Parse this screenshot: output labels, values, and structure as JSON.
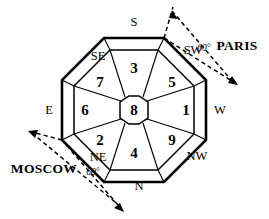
{
  "diagram": {
    "background_color": "#ffffff",
    "line_color": "#000000",
    "center": {
      "label": "8",
      "name": "center-cell"
    },
    "sectors": [
      {
        "label": "1",
        "direction": "W",
        "x": 186,
        "y": 110
      },
      {
        "label": "5",
        "direction": "SW",
        "x": 172,
        "y": 82
      },
      {
        "label": "3",
        "direction": "S",
        "x": 134,
        "y": 68
      },
      {
        "label": "7",
        "direction": "SE",
        "x": 100,
        "y": 82
      },
      {
        "label": "6",
        "direction": "E",
        "x": 85,
        "y": 110
      },
      {
        "label": "2",
        "direction": "NE",
        "x": 100,
        "y": 140
      },
      {
        "label": "4",
        "direction": "N",
        "x": 134,
        "y": 153
      },
      {
        "label": "9",
        "direction": "NW",
        "x": 172,
        "y": 140
      }
    ],
    "direction_labels": [
      {
        "text": "S",
        "x": 134,
        "y": 22,
        "name": "direction-label-s"
      },
      {
        "text": "SW",
        "x": 193,
        "y": 50,
        "name": "direction-label-sw"
      },
      {
        "text": "W",
        "x": 220,
        "y": 110,
        "name": "direction-label-w"
      },
      {
        "text": "NW",
        "x": 197,
        "y": 156,
        "name": "direction-label-nw"
      },
      {
        "text": "N",
        "x": 139,
        "y": 186,
        "name": "direction-label-n"
      },
      {
        "text": "NE",
        "x": 98,
        "y": 157,
        "name": "direction-label-ne"
      },
      {
        "text": "E",
        "x": 49,
        "y": 110,
        "name": "direction-label-e"
      },
      {
        "text": "SE",
        "x": 98,
        "y": 56,
        "name": "direction-label-se"
      }
    ],
    "annotations": [
      {
        "city": "PARIS",
        "city_x": 237,
        "city_y": 45,
        "angle": "60°",
        "angle_x": 204,
        "angle_y": 48,
        "name": "paris-annotation"
      },
      {
        "city": "MOSCOW",
        "city_x": 44,
        "city_y": 168,
        "angle": "60°",
        "angle_x": 93,
        "angle_y": 172,
        "name": "moscow-annotation"
      }
    ]
  }
}
